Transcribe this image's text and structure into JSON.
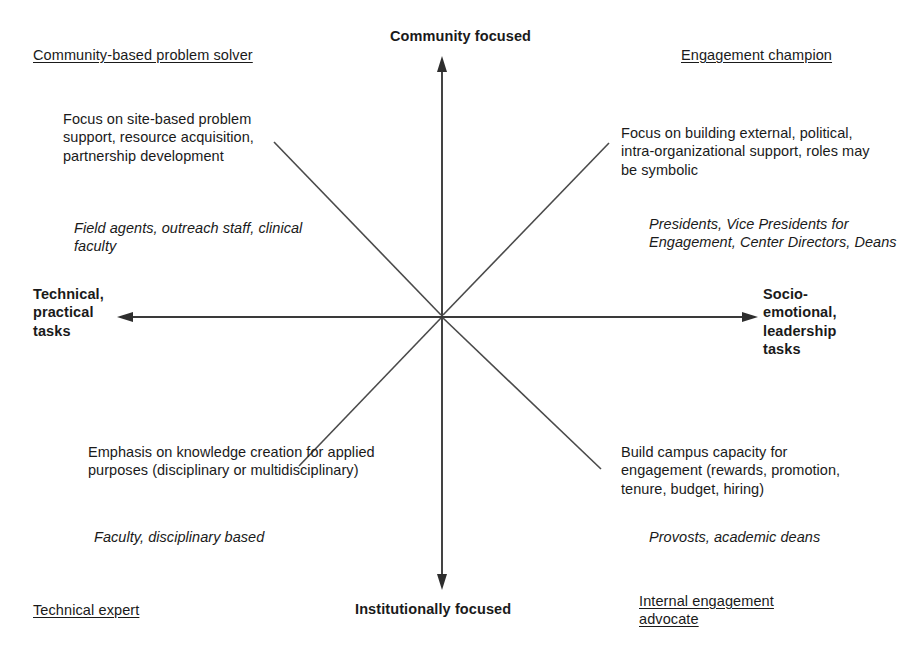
{
  "diagram": {
    "type": "quadrant",
    "stroke_color": "#3a3a3a",
    "text_color": "#1a1a1a",
    "background": "#ffffff"
  },
  "axes": {
    "vertical": {
      "top_label": "Community focused",
      "bottom_label": "Institutionally focused"
    },
    "horizontal": {
      "left_label": "Technical,\npractical\ntasks",
      "right_label": "Socio-\nemotional,\nleadership\ntasks"
    }
  },
  "quadrants": [
    {
      "position": "top-left",
      "title": "Community-based problem solver",
      "description": "Focus on site-based problem support, resource acquisition, partnership development",
      "roles": "Field agents, outreach staff, clinical faculty"
    },
    {
      "position": "top-right",
      "title": "Engagement champion",
      "description": "Focus on building external, political, intra-organizational support, roles may be symbolic",
      "roles": "Presidents, Vice Presidents for Engagement, Center Directors, Deans"
    },
    {
      "position": "bottom-left",
      "title": "Technical expert",
      "description": "Emphasis on knowledge creation for applied purposes (disciplinary or multidisciplinary)",
      "roles": "Faculty, disciplinary based"
    },
    {
      "position": "bottom-right",
      "title": "Internal engagement advocate",
      "description": "Build campus capacity for engagement (rewards, promotion, tenure, budget, hiring)",
      "roles": "Provosts, academic deans"
    }
  ]
}
